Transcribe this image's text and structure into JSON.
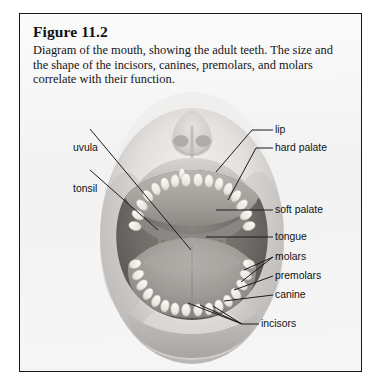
{
  "figure": {
    "title": "Figure 11.2",
    "caption": "Diagram of the mouth, showing the adult teeth. The size and the shape of the incisors, canines, premolars, and molars correlate with their function."
  },
  "colors": {
    "panel_border": "#16181a",
    "panel_background": "#f4f4f4",
    "leader_line": "#1a1c1e",
    "label_text": "#111315",
    "skin_light": "#e8e6e4",
    "skin_mid": "#c9c6c4",
    "skin_shadow": "#a7a4a2",
    "oral_cavity_dark": "#6e6c6b",
    "oral_cavity_deep": "#5a5857",
    "tongue": "#98part",
    "tooth_white": "#f3f1ec"
  },
  "labels": {
    "uvula": "uvula",
    "tonsil": "tonsil",
    "lip": "lip",
    "hard_palate": "hard palate",
    "soft_palate": "soft palate",
    "tongue": "tongue",
    "molars": "molars",
    "premolars": "premolars",
    "canine": "canine",
    "incisors": "incisors"
  },
  "callouts": [
    {
      "id": "uvula",
      "label": "uvula",
      "side": "left",
      "text_x": 53,
      "text_y": 128
    },
    {
      "id": "tonsil",
      "label": "tonsil",
      "side": "left",
      "text_x": 53,
      "text_y": 169
    },
    {
      "id": "lip",
      "label": "lip",
      "side": "right",
      "text_x": 272,
      "text_y": 120
    },
    {
      "id": "hard-palate",
      "label": "hard palate",
      "side": "right",
      "text_x": 272,
      "text_y": 138
    },
    {
      "id": "soft-palate",
      "label": "soft palate",
      "side": "right",
      "text_x": 272,
      "text_y": 199
    },
    {
      "id": "tongue",
      "label": "tongue",
      "side": "right",
      "text_x": 272,
      "text_y": 226
    },
    {
      "id": "molars",
      "label": "molars",
      "side": "right",
      "text_x": 272,
      "text_y": 246
    },
    {
      "id": "premolars",
      "label": "premolars",
      "side": "right",
      "text_x": 272,
      "text_y": 265
    },
    {
      "id": "canine",
      "label": "canine",
      "side": "right",
      "text_x": 272,
      "text_y": 284
    },
    {
      "id": "incisors",
      "label": "incisors",
      "side": "right",
      "text_x": 241,
      "text_y": 313
    }
  ],
  "anatomy_parts": [
    "nose",
    "upper lip",
    "lower lip",
    "hard palate",
    "soft palate",
    "uvula",
    "tonsil",
    "tongue",
    "upper dental arch",
    "lower dental arch",
    "incisors",
    "canine",
    "premolars",
    "molars",
    "chin"
  ]
}
